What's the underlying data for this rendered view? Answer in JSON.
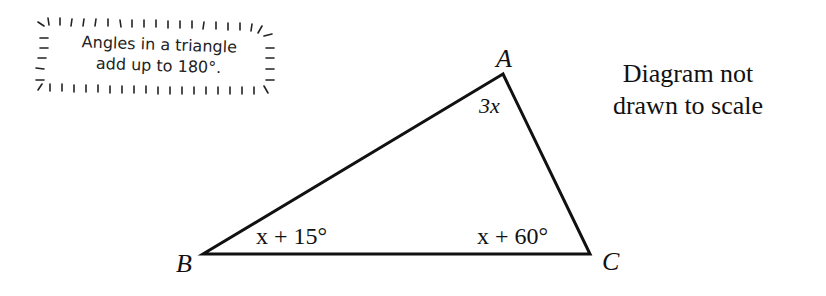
{
  "hint": {
    "line1": "Angles in a triangle",
    "line2": "add up to 180°."
  },
  "note": {
    "line1": "Diagram not",
    "line2": "drawn to scale"
  },
  "triangle": {
    "vertices": {
      "A": {
        "label": "A",
        "x": 503,
        "y": 74
      },
      "B": {
        "label": "B",
        "x": 203,
        "y": 254
      },
      "C": {
        "label": "C",
        "x": 590,
        "y": 254
      }
    },
    "angles": {
      "A": "3x",
      "B": "x + 15°",
      "C": "x + 60°"
    },
    "stroke_color": "#111111"
  }
}
